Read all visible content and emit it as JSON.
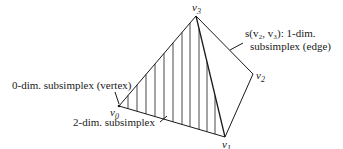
{
  "vertices": {
    "v0": {
      "label": "v",
      "sub": "0"
    },
    "v1": {
      "label": "v",
      "sub": "1"
    },
    "v2": {
      "label": "v",
      "sub": "2"
    },
    "v3": {
      "label": "v",
      "sub": "3"
    }
  },
  "annotations": {
    "edge_line1": "s(v₂, v₃): 1-dim.",
    "edge_line2": "subsimplex (edge)",
    "vertex_label": "0-dim. subsimplex (vertex)",
    "face_label": "2-dim. subsimplex"
  },
  "colors": {
    "stroke": "#1a1a1a",
    "background": "#ffffff"
  }
}
